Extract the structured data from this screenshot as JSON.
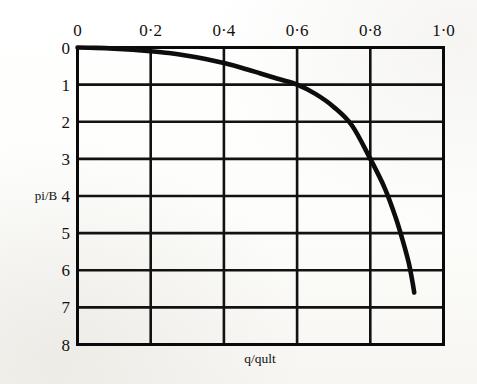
{
  "chart_data": {
    "type": "line",
    "title": "",
    "xlabel": "q/qult",
    "ylabel": "pi/B",
    "xlim": [
      0,
      1.0
    ],
    "ylim": [
      0,
      8
    ],
    "y_axis_inverted": true,
    "grid": true,
    "legend": null,
    "x_ticks": [
      0,
      0.2,
      0.4,
      0.6,
      0.8,
      1.0
    ],
    "x_tick_labels": [
      "0",
      "0·2",
      "0·4",
      "0·6",
      "0·8",
      "1·0"
    ],
    "y_ticks": [
      0,
      1,
      2,
      3,
      4,
      5,
      6,
      7,
      8
    ],
    "y_tick_labels": [
      "0",
      "1",
      "2",
      "3",
      "4",
      "5",
      "6",
      "7",
      "8"
    ],
    "x_axis_position": "top",
    "y_axis_position": "left",
    "series": [
      {
        "name": "settlement-curve",
        "color": "#0d0d0d",
        "x": [
          0.0,
          0.05,
          0.1,
          0.15,
          0.2,
          0.25,
          0.3,
          0.35,
          0.4,
          0.45,
          0.5,
          0.55,
          0.6,
          0.65,
          0.7,
          0.75,
          0.8,
          0.84,
          0.87,
          0.89,
          0.905,
          0.915,
          0.92
        ],
        "y": [
          0.0,
          0.01,
          0.03,
          0.06,
          0.1,
          0.15,
          0.22,
          0.31,
          0.42,
          0.55,
          0.7,
          0.85,
          1.0,
          1.25,
          1.6,
          2.1,
          3.0,
          3.8,
          4.6,
          5.25,
          5.8,
          6.3,
          6.6
        ]
      }
    ],
    "annotations": []
  },
  "axes": {
    "x_title": "q/qult",
    "y_title": "pi/B"
  },
  "style": {
    "curve_color": "#0d0d0d",
    "grid_color": "#121212",
    "border_color": "#0a0a0a",
    "background": "#fdfdfc",
    "text_color": "#111111"
  }
}
